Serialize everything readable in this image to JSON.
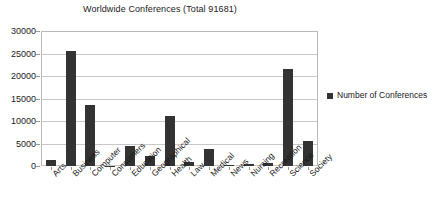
{
  "chart_data": {
    "type": "bar",
    "title": "Worldwide Conferences (Total 91681)",
    "xlabel": "",
    "ylabel": "",
    "ylim": [
      0,
      30000
    ],
    "yticks": [
      0,
      5000,
      10000,
      15000,
      20000,
      25000,
      30000
    ],
    "ytick_labels": [
      "0",
      "5000",
      "10000",
      "15000",
      "20000",
      "25000",
      "30000"
    ],
    "grid": true,
    "legend_position": "right",
    "bar_color": "#333333",
    "categories": [
      "Arts",
      "Business",
      "Computer",
      "Consumers",
      "Education",
      "Geographical",
      "Health",
      "Law",
      "Medical",
      "News",
      "Nursing",
      "Recreation",
      "Science",
      "Society"
    ],
    "series": [
      {
        "name": "Number of Conferences",
        "values": [
          1400,
          25600,
          13500,
          80,
          4400,
          2200,
          11100,
          800,
          3800,
          300,
          500,
          600,
          21600,
          5600
        ]
      }
    ],
    "total": 91681
  },
  "legend": {
    "entries": [
      {
        "label": "Number of Conferences",
        "color": "#333333",
        "marker": "square-marker"
      }
    ]
  }
}
